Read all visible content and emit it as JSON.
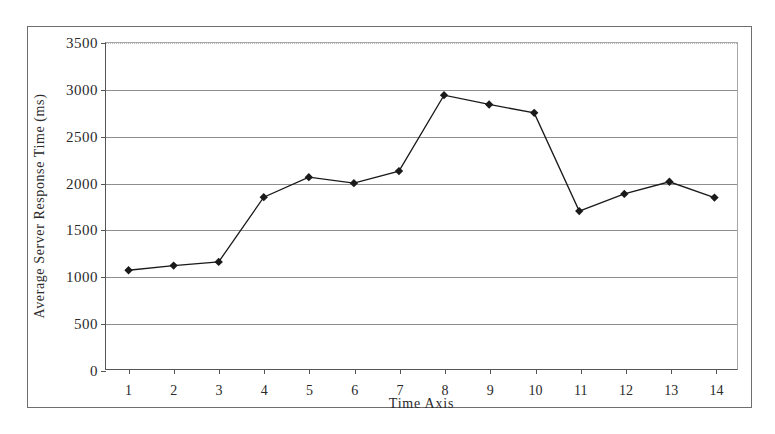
{
  "chart_data": {
    "type": "line",
    "title": "",
    "xlabel": "Time Axis",
    "ylabel": "Average Server Response Time (ms)",
    "x": [
      1,
      2,
      3,
      4,
      5,
      6,
      7,
      8,
      9,
      10,
      11,
      12,
      13,
      14
    ],
    "xtick_labels": [
      "1",
      "2",
      "3",
      "4",
      "5",
      "6",
      "7",
      "8",
      "9",
      "10",
      "11",
      "12",
      "13",
      "14"
    ],
    "ytick_labels": [
      "0",
      "500",
      "1000",
      "1500",
      "2000",
      "2500",
      "3000",
      "3500"
    ],
    "ytick_values": [
      0,
      500,
      1000,
      1500,
      2000,
      2500,
      3000,
      3500
    ],
    "ylim": [
      0,
      3500
    ],
    "xlim": [
      0.5,
      14.5
    ],
    "grid": "horizontal",
    "legend": "none",
    "series": [
      {
        "name": "Average Server Response Time",
        "marker": "diamond",
        "color": "#1a1a1a",
        "values": [
          1060,
          1110,
          1150,
          1845,
          2060,
          1995,
          2125,
          2940,
          2840,
          2750,
          1695,
          1880,
          2010,
          1840
        ]
      }
    ]
  },
  "figure": {
    "frame_border_color": "#6e6e6e",
    "gridline_color": "#8e8e8e",
    "axis_color": "#555555",
    "background": "#ffffff"
  }
}
